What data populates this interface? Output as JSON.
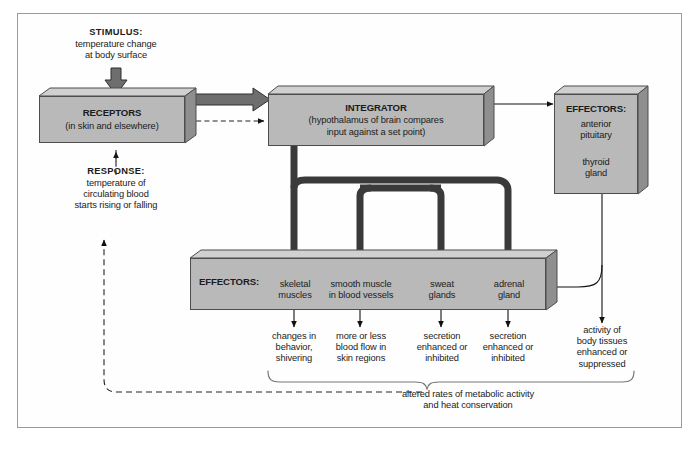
{
  "diagram": {
    "stimulus": {
      "label": "STIMULUS:",
      "text": "temperature change\nat body surface"
    },
    "response": {
      "label": "RESPONSE:",
      "text": "temperature of\ncirculating blood\nstarts rising or falling"
    },
    "receptors": {
      "header": "RECEPTORS",
      "sub": "(in skin and elsewhere)"
    },
    "integrator": {
      "header": "INTEGRATOR",
      "sub": "(hypothalamus of brain compares\ninput against a set point)"
    },
    "effectors_right": {
      "header": "EFFECTORS:",
      "item1": "anterior\npituitary",
      "item2": "thyroid\ngland"
    },
    "effectors_bottom": {
      "header": "EFFECTORS:",
      "items": [
        "skeletal\nmuscles",
        "smooth muscle\nin blood vessels",
        "sweat\nglands",
        "adrenal\ngland"
      ]
    },
    "outcomes": [
      "changes in\nbehavior,\nshivering",
      "more or less\nblood flow in\nskin regions",
      "secretion\nenhanced or\ninhibited",
      "secretion\nenhanced or\ninhibited",
      "activity of\nbody tissues\nenhanced or\nsuppressed"
    ],
    "summary": "altered rates of metabolic activity\nand heat conservation",
    "colors": {
      "box_fill": "#b9b9b9",
      "box_top": "#d0d0d0",
      "box_side": "#8f8f8f",
      "outline": "#4d4d4d",
      "thick_arrow": "#3a3a3a",
      "thin_line": "#111111",
      "frame": "#9a9a9a",
      "background": "#ffffff"
    }
  }
}
